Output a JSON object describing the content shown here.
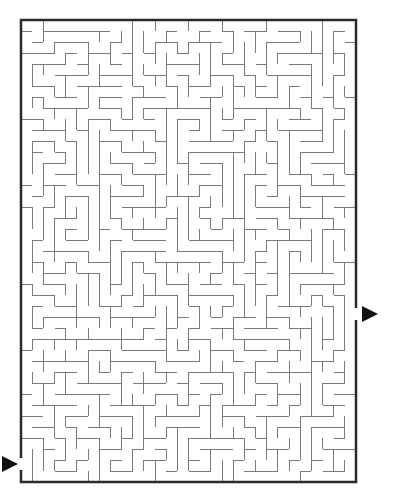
{
  "puzzle": {
    "type": "maze",
    "grid": {
      "cols": 30,
      "rows": 42,
      "cell_px": 11.17,
      "origin_x": 21,
      "origin_y": 20,
      "right_x": 356,
      "bottom_y": 482
    },
    "entrance": {
      "side": "left",
      "arrow_y": 464,
      "icon": "right-pointing-triangle"
    },
    "exit": {
      "side": "right",
      "arrow_y": 314,
      "icon": "right-pointing-triangle"
    },
    "colors": {
      "border": "#2a2a2a",
      "walls": "#7a7a7a",
      "arrow": "#111111",
      "background": "#ffffff"
    }
  }
}
